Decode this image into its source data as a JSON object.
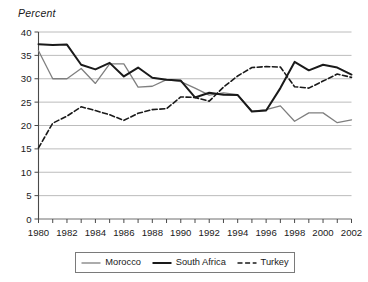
{
  "chart_data": {
    "type": "line",
    "title": "",
    "ylabel": "Percent",
    "xlabel": "",
    "ylim": [
      0,
      40
    ],
    "ytick_step": 5,
    "yticks": [
      "0",
      "5",
      "10",
      "15",
      "20",
      "25",
      "30",
      "35",
      "40"
    ],
    "xlim": [
      1980,
      2002
    ],
    "x": [
      1980,
      1981,
      1982,
      1983,
      1984,
      1985,
      1986,
      1987,
      1988,
      1989,
      1990,
      1991,
      1992,
      1993,
      1994,
      1995,
      1996,
      1997,
      1998,
      1999,
      2000,
      2001,
      2002
    ],
    "xticks": [
      "1980",
      "1982",
      "1984",
      "1986",
      "1988",
      "1990",
      "1992",
      "1994",
      "1996",
      "1998",
      "2000",
      "2002"
    ],
    "grid": "horizontal",
    "legend_position": "bottom",
    "series": [
      {
        "name": "Morocco",
        "color": "#7f7f7f",
        "style": "solid",
        "width": 1.3,
        "values": [
          36.0,
          30.0,
          30.0,
          32.2,
          29.0,
          33.2,
          33.2,
          28.2,
          28.4,
          29.8,
          29.4,
          28.0,
          26.5,
          27.0,
          26.6,
          23.0,
          23.4,
          24.2,
          20.9,
          22.7,
          22.7,
          20.6,
          21.2
        ]
      },
      {
        "name": "South Africa",
        "color": "#1a1a1a",
        "style": "solid",
        "width": 2.0,
        "values": [
          37.4,
          37.2,
          37.3,
          33.0,
          32.0,
          33.4,
          30.5,
          32.4,
          30.2,
          29.8,
          29.6,
          26.0,
          27.0,
          26.6,
          26.5,
          23.0,
          23.2,
          28.0,
          33.6,
          31.8,
          33.0,
          32.4,
          30.9
        ]
      },
      {
        "name": "Turkey",
        "color": "#1a1a1a",
        "style": "dashed",
        "width": 1.6,
        "values": [
          15.2,
          20.5,
          22.0,
          24.0,
          23.2,
          22.3,
          21.1,
          22.6,
          23.4,
          23.6,
          26.1,
          26.0,
          25.2,
          28.2,
          30.6,
          32.4,
          32.6,
          32.5,
          28.3,
          28.0,
          29.5,
          31.0,
          30.3
        ]
      }
    ],
    "legend": [
      {
        "label": "Morocco",
        "color": "#7f7f7f",
        "style": "solid"
      },
      {
        "label": "South Africa",
        "color": "#1a1a1a",
        "style": "solid"
      },
      {
        "label": "Turkey",
        "color": "#1a1a1a",
        "style": "dashed"
      }
    ]
  }
}
